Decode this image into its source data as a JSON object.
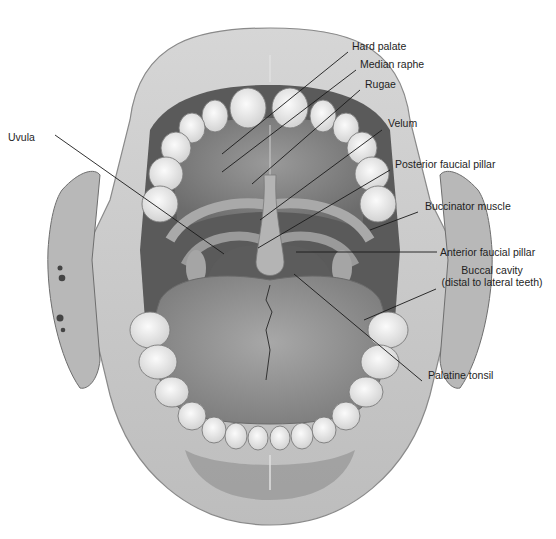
{
  "figure": {
    "colors": {
      "background": "#ffffff",
      "lip": "#cfcfcf",
      "lip_edge": "#8a8a8a",
      "teeth": "#ececec",
      "teeth_edge": "#7a7a7a",
      "palate": "#8e8e8e",
      "palate_dark": "#6f6f6f",
      "tongue": "#9a9a9a",
      "cheek": "#b8b8b8",
      "throat": "#4a4a4a",
      "leader_line": "#1a1a1a",
      "label_text": "#1e1e1e"
    }
  },
  "labels": [
    {
      "id": "hard-palate",
      "text": "Hard palate",
      "x": 352,
      "y": 46,
      "line": [
        348,
        52,
        222,
        154
      ]
    },
    {
      "id": "median-raphe",
      "text": "Median raphe",
      "x": 360,
      "y": 64,
      "line": [
        356,
        70,
        222,
        172
      ]
    },
    {
      "id": "rugae",
      "text": "Rugae",
      "x": 365,
      "y": 84,
      "line": [
        360,
        90,
        252,
        184
      ]
    },
    {
      "id": "velum",
      "text": "Velum",
      "x": 388,
      "y": 123,
      "line": [
        382,
        130,
        260,
        220
      ]
    },
    {
      "id": "posterior-faucial-pillar",
      "text": "Posterior faucial pillar",
      "x": 395,
      "y": 164,
      "line": [
        390,
        170,
        258,
        248
      ]
    },
    {
      "id": "buccinator-muscle",
      "text": "Buccinator muscle",
      "x": 425,
      "y": 205,
      "line": [
        418,
        212,
        370,
        230
      ]
    },
    {
      "id": "anterior-faucial-pillar",
      "text": "Anterior faucial pillar",
      "x": 440,
      "y": 246,
      "line": [
        437,
        252,
        296,
        252
      ]
    },
    {
      "id": "buccal-cavity",
      "text": "Buccal cavity",
      "text2": "(distal to lateral teeth)",
      "x": 432,
      "y": 270,
      "line": [
        436,
        289,
        364,
        320
      ]
    },
    {
      "id": "palatine-tonsil",
      "text": "Palatine tonsil",
      "x": 428,
      "y": 375,
      "line": [
        422,
        381,
        294,
        274
      ]
    },
    {
      "id": "uvula",
      "text": "Uvula",
      "x": 36,
      "y": 129,
      "line": [
        55,
        135,
        224,
        254
      ]
    }
  ]
}
